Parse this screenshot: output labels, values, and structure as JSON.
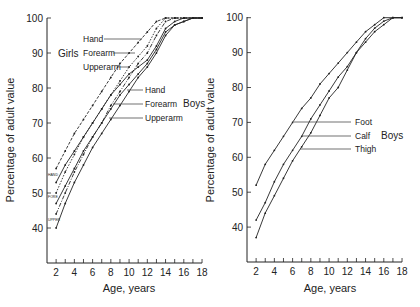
{
  "chart_data": [
    {
      "type": "line",
      "panel": "left",
      "title": "",
      "xlabel": "Age, years",
      "ylabel": "Percentage of adult value",
      "xticks": [
        2,
        4,
        6,
        8,
        10,
        12,
        14,
        16,
        18
      ],
      "yticks": [
        40,
        50,
        60,
        70,
        80,
        90,
        100
      ],
      "xlim": [
        1,
        18
      ],
      "ylim": [
        30,
        100
      ],
      "grid": false,
      "group_labels": {
        "girls": "Girls",
        "boys": "Boys"
      },
      "x": [
        2,
        3,
        4,
        5,
        6,
        7,
        8,
        9,
        10,
        11,
        12,
        13,
        14,
        15,
        16,
        17,
        18
      ],
      "series": [
        {
          "name": "Hand",
          "group": "Girls",
          "style": "dashed",
          "start_label": "HAND",
          "values": [
            57,
            62,
            67,
            71,
            75,
            79,
            83,
            87,
            90,
            93,
            96,
            99,
            100,
            100,
            100,
            100,
            100
          ]
        },
        {
          "name": "Forearm",
          "group": "Girls",
          "style": "dashed",
          "start_label": "FORE",
          "values": [
            50,
            56,
            61,
            66,
            70,
            74,
            78,
            82,
            86,
            89,
            92,
            97,
            100,
            100,
            100,
            100,
            100
          ]
        },
        {
          "name": "Upperarm",
          "group": "Girls",
          "style": "dashed",
          "start_label": "UPPER",
          "values": [
            44,
            50,
            56,
            61,
            66,
            70,
            75,
            79,
            83,
            87,
            90,
            95,
            99,
            100,
            100,
            100,
            100
          ]
        },
        {
          "name": "Hand",
          "group": "Boys",
          "style": "solid",
          "values": [
            53,
            58,
            62,
            66,
            70,
            74,
            78,
            81,
            84,
            86,
            88,
            92,
            97,
            99,
            100,
            100,
            100
          ]
        },
        {
          "name": "Forearm",
          "group": "Boys",
          "style": "solid",
          "values": [
            47,
            52,
            57,
            62,
            66,
            70,
            74,
            78,
            81,
            84,
            87,
            91,
            96,
            98,
            99,
            100,
            100
          ]
        },
        {
          "name": "Upperarm",
          "group": "Boys",
          "style": "solid",
          "values": [
            40,
            47,
            53,
            58,
            63,
            67,
            71,
            75,
            79,
            83,
            86,
            90,
            95,
            98,
            99,
            100,
            100
          ]
        }
      ],
      "annotations": [
        {
          "text": "Hand",
          "target": "Girls Hand"
        },
        {
          "text": "Forearm",
          "target": "Girls Forearm"
        },
        {
          "text": "Upperarm",
          "target": "Girls Upperarm"
        },
        {
          "text": "Girls"
        },
        {
          "text": "Hand",
          "target": "Boys Hand"
        },
        {
          "text": "Forearm",
          "target": "Boys Forearm"
        },
        {
          "text": "Upperarm",
          "target": "Boys Upperarm"
        },
        {
          "text": "Boys"
        }
      ]
    },
    {
      "type": "line",
      "panel": "right",
      "title": "",
      "xlabel": "Age, years",
      "ylabel": "Percentage of adult value",
      "xticks": [
        2,
        4,
        6,
        8,
        10,
        12,
        14,
        16,
        18
      ],
      "yticks": [
        40,
        50,
        60,
        70,
        80,
        90,
        100
      ],
      "xlim": [
        1,
        18
      ],
      "ylim": [
        30,
        100
      ],
      "grid": false,
      "group_labels": {
        "boys": "Boys"
      },
      "x": [
        2,
        3,
        4,
        5,
        6,
        7,
        8,
        9,
        10,
        11,
        12,
        13,
        14,
        15,
        16,
        17,
        18
      ],
      "series": [
        {
          "name": "Foot",
          "group": "Boys",
          "style": "solid",
          "values": [
            52,
            58,
            62,
            66,
            70,
            74,
            77,
            81,
            84,
            87,
            90,
            93,
            96,
            98,
            100,
            100,
            100
          ]
        },
        {
          "name": "Calf",
          "group": "Boys",
          "style": "solid",
          "values": [
            42,
            47,
            53,
            58,
            62,
            66,
            71,
            75,
            79,
            83,
            86,
            90,
            94,
            97,
            99,
            100,
            100
          ]
        },
        {
          "name": "Thigh",
          "group": "Boys",
          "style": "solid",
          "values": [
            37,
            44,
            49,
            54,
            59,
            63,
            67,
            72,
            77,
            80,
            85,
            90,
            93,
            96,
            98,
            100,
            100
          ]
        }
      ],
      "annotations": [
        {
          "text": "Foot",
          "target": "Foot"
        },
        {
          "text": "Calf",
          "target": "Calf"
        },
        {
          "text": "Thigh",
          "target": "Thigh"
        },
        {
          "text": "Boys"
        }
      ]
    }
  ],
  "labels": {
    "left": {
      "ylabel": "Percentage of adult value",
      "xlabel": "Age, years",
      "girls": "Girls",
      "boys": "Boys",
      "girls_hand": "Hand",
      "girls_forearm": "Forearm",
      "girls_upperarm": "Upperarm",
      "boys_hand": "Hand",
      "boys_forearm": "Forearm",
      "boys_upperarm": "Upperarm",
      "start_hand": "HAND",
      "start_fore": "FORE",
      "start_upper": "UPPER"
    },
    "right": {
      "ylabel": "Percentage of adult value",
      "xlabel": "Age, years",
      "boys": "Boys",
      "foot": "Foot",
      "calf": "Calf",
      "thigh": "Thigh"
    }
  },
  "colors": {
    "ink": "#222222",
    "background": "#ffffff"
  }
}
